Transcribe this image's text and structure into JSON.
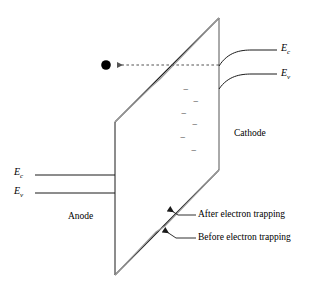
{
  "figure": {
    "type": "schematic-diagram",
    "width": 322,
    "height": 292,
    "background_color": "#ffffff"
  },
  "labels": {
    "anode": "Anode",
    "cathode": "Cathode",
    "left_conduction_band": "E",
    "left_conduction_band_sub": "c",
    "left_valence_band": "E",
    "left_valence_band_sub": "v",
    "right_conduction_band": "E",
    "right_conduction_band_sub": "c",
    "right_valence_band": "E",
    "right_valence_band_sub": "v",
    "after_trapping": "After electron trapping",
    "before_trapping": "Before electron trapping"
  },
  "label_positions": {
    "anode": {
      "x": 68,
      "y": 212
    },
    "cathode": {
      "x": 234,
      "y": 129
    },
    "left_conduction_band": {
      "x": 14,
      "y": 167
    },
    "left_valence_band": {
      "x": 14,
      "y": 186
    },
    "right_conduction_band": {
      "x": 281,
      "y": 43
    },
    "right_valence_band": {
      "x": 281,
      "y": 68
    },
    "after_trapping": {
      "x": 188,
      "y": 210
    },
    "before_trapping": {
      "x": 188,
      "y": 233
    }
  },
  "colors": {
    "line_dark": "#1a1a1a",
    "line_gray": "#9a9a9a",
    "line_mid": "#555555",
    "electron_fill": "#000000",
    "minus_sign": "#3a3a3a",
    "text": "#000000"
  },
  "geometry": {
    "plane_front_top": {
      "x": 115,
      "y": 122
    },
    "plane_front_bottom": {
      "x": 115,
      "y": 275
    },
    "plane_back_top": {
      "x": 219,
      "y": 18
    },
    "plane_back_bottom": {
      "x": 219,
      "y": 170
    },
    "before_trapping_top_edge": [
      [
        115,
        122
      ],
      [
        219,
        18
      ]
    ],
    "before_trapping_bottom_edge": [
      [
        115,
        275
      ],
      [
        219,
        170
      ]
    ],
    "after_trapping_top_polyline": [
      [
        115,
        122
      ],
      [
        151,
        87
      ],
      [
        160,
        79
      ],
      [
        219,
        18
      ]
    ],
    "after_trapping_bottom_polyline": [
      [
        115,
        275
      ],
      [
        156,
        232
      ],
      [
        165,
        226
      ],
      [
        219,
        170
      ]
    ],
    "left_band_ec": {
      "x1": 35,
      "y1": 175,
      "x2": 115,
      "y2": 175
    },
    "left_band_ev": {
      "x1": 35,
      "y1": 193,
      "x2": 115,
      "y2": 193
    },
    "right_band_ec_curve": {
      "start": [
        219,
        66
      ],
      "end": [
        277,
        50
      ]
    },
    "right_band_ev_curve": {
      "start": [
        219,
        89
      ],
      "end": [
        277,
        74
      ]
    },
    "electron_dot": {
      "cx": 106,
      "cy": 65,
      "r": 5
    },
    "dashed_arrow": {
      "x1": 219,
      "y1": 65,
      "x2": 115,
      "y2": 65
    },
    "minus_signs": [
      {
        "x": 183,
        "y": 89
      },
      {
        "x": 193,
        "y": 101
      },
      {
        "x": 181,
        "y": 113
      },
      {
        "x": 192,
        "y": 124
      },
      {
        "x": 180,
        "y": 137
      },
      {
        "x": 191,
        "y": 150
      }
    ],
    "leader_after": {
      "arrow": [
        168,
        210
      ],
      "bend": [
        178,
        215
      ],
      "end": [
        196,
        215
      ]
    },
    "leader_before": {
      "arrow": [
        162,
        231
      ],
      "bend": [
        176,
        238
      ],
      "end": [
        196,
        238
      ]
    }
  },
  "icons": {
    "electron": "electron-dot-icon",
    "arrow": "dashed-arrow-icon"
  }
}
